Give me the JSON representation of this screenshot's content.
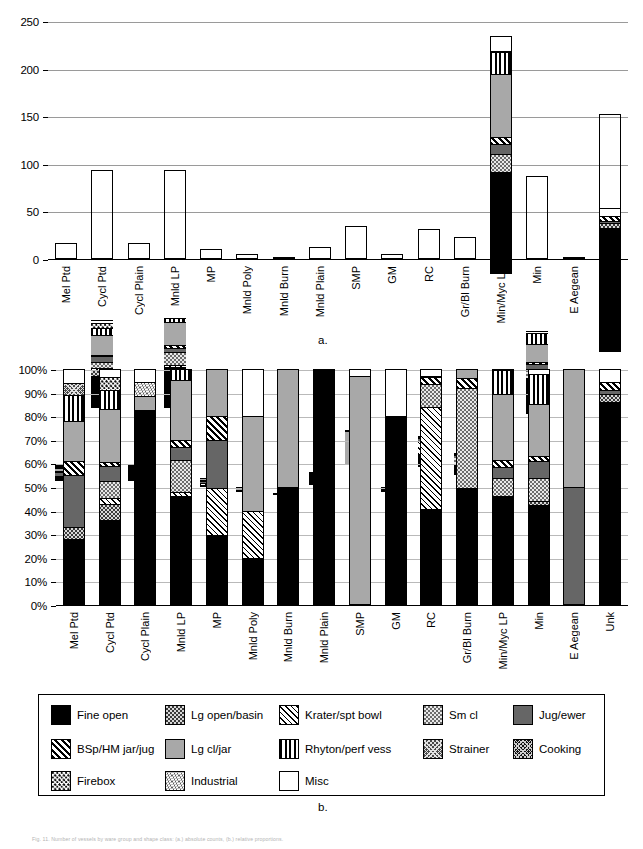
{
  "figure": {
    "panel_a_label": "a.",
    "panel_b_label": "b.",
    "caption": "Fig. 11. Number of vessels by ware group and shape class: (a.) absolute counts, (b.) relative proportions."
  },
  "series": [
    {
      "key": "fine_open",
      "label": "Fine open",
      "pattern": "p-fine-open"
    },
    {
      "key": "lg_open_basin",
      "label": "Lg open/basin",
      "pattern": "p-lg-open-basin"
    },
    {
      "key": "krater_spt_bowl",
      "label": "Krater/spt bowl",
      "pattern": "p-krater"
    },
    {
      "key": "sm_cl",
      "label": "Sm cl",
      "pattern": "p-sm-cl"
    },
    {
      "key": "jug_ewer",
      "label": "Jug/ewer",
      "pattern": "p-jug-ewer"
    },
    {
      "key": "bsp_hm_jar_jug",
      "label": "BSp/HM jar/jug",
      "pattern": "p-bsp-hm"
    },
    {
      "key": "lg_cl_jar",
      "label": "Lg cl/jar",
      "pattern": "p-lg-cl-jar"
    },
    {
      "key": "rhyton_perf_vess",
      "label": "Rhyton/perf vess",
      "pattern": "p-rhyton"
    },
    {
      "key": "strainer",
      "label": "Strainer",
      "pattern": "p-strainer"
    },
    {
      "key": "cooking",
      "label": "Cooking",
      "pattern": "p-cooking"
    },
    {
      "key": "firebox",
      "label": "Firebox",
      "pattern": "p-firebox"
    },
    {
      "key": "industrial",
      "label": "Industrial",
      "pattern": "p-industrial"
    },
    {
      "key": "misc",
      "label": "Misc",
      "pattern": "p-misc"
    }
  ],
  "chart_data": [
    {
      "id": "panel_a",
      "type": "bar",
      "stacked": true,
      "title": "",
      "xlabel": "",
      "ylabel": "",
      "ylim": [
        0,
        250
      ],
      "yticks": [
        0,
        50,
        100,
        150,
        200,
        250
      ],
      "ytick_labels": [
        "0",
        "50",
        "100",
        "150",
        "200",
        "250"
      ],
      "grid": true,
      "legend_position": "below",
      "categories": [
        "Mel Ptd",
        "Cycl Ptd",
        "Cycl Plain",
        "Mnld LP",
        "MP",
        "Mnld Poly",
        "Mnld Burn",
        "Mnld Plain",
        "SMP",
        "GM",
        "RC",
        "Gr/Bl Burn",
        "Min/Myc LP",
        "Min",
        "E Aegean",
        "Unk"
      ],
      "totals": [
        18,
        94,
        17,
        94,
        10,
        5,
        2,
        13,
        35,
        5,
        32,
        23,
        234,
        87,
        2,
        152
      ],
      "series": [
        {
          "name": "Fine open",
          "values": [
            5,
            34,
            14,
            43,
            3,
            1,
            1,
            13,
            0,
            4,
            13,
            11,
            107,
            37,
            0,
            131
          ]
        },
        {
          "name": "Lg open/basin",
          "values": [
            0,
            6,
            0,
            0,
            0,
            0,
            0,
            0,
            0,
            0,
            0,
            0,
            0,
            1,
            0,
            5
          ]
        },
        {
          "name": "Krater/spt bowl",
          "values": [
            0,
            2,
            0,
            2,
            2,
            1,
            0,
            0,
            0,
            0,
            14,
            0,
            0,
            0,
            0,
            0
          ]
        },
        {
          "name": "Sm cl",
          "values": [
            0,
            7,
            0,
            13,
            0,
            0,
            0,
            0,
            0,
            0,
            3,
            10,
            19,
            9,
            0,
            0
          ]
        },
        {
          "name": "Jug/ewer",
          "values": [
            4,
            6,
            0,
            5,
            2,
            0,
            0,
            0,
            0,
            0,
            0,
            0,
            11,
            6,
            1,
            2
          ]
        },
        {
          "name": "BSp/HM jar/jug",
          "values": [
            1,
            1,
            0,
            3,
            1,
            0,
            0,
            0,
            0,
            0,
            1,
            1,
            7,
            2,
            0,
            5
          ]
        },
        {
          "name": "Lg cl/jar",
          "values": [
            3,
            21,
            1,
            24,
            2,
            2,
            1,
            0,
            34,
            0,
            0,
            1,
            66,
            19,
            1,
            0
          ]
        },
        {
          "name": "Rhyton/perf vess",
          "values": [
            2,
            8,
            0,
            4,
            0,
            0,
            0,
            0,
            0,
            0,
            0,
            0,
            23,
            11,
            0,
            0
          ]
        },
        {
          "name": "Strainer",
          "values": [
            1,
            0,
            0,
            0,
            0,
            0,
            0,
            0,
            0,
            0,
            0,
            0,
            0,
            0,
            0,
            0
          ]
        },
        {
          "name": "Cooking",
          "values": [
            0,
            0,
            0,
            0,
            0,
            0,
            0,
            0,
            0,
            0,
            0,
            0,
            0,
            0,
            0,
            0
          ]
        },
        {
          "name": "Firebox",
          "values": [
            0,
            5,
            0,
            0,
            0,
            0,
            0,
            0,
            0,
            0,
            0,
            0,
            0,
            0,
            0,
            0
          ]
        },
        {
          "name": "Industrial",
          "values": [
            0,
            0,
            1,
            0,
            0,
            0,
            0,
            0,
            0,
            0,
            0,
            0,
            0,
            0,
            0,
            0
          ]
        },
        {
          "name": "Misc",
          "values": [
            1,
            3,
            1,
            0,
            0,
            1,
            0,
            0,
            1,
            1,
            1,
            0,
            1,
            2,
            0,
            9
          ]
        }
      ]
    },
    {
      "id": "panel_b",
      "type": "bar",
      "stacked": true,
      "normalized": true,
      "title": "",
      "xlabel": "",
      "ylabel": "",
      "ylim": [
        0,
        100
      ],
      "yticks": [
        0,
        10,
        20,
        30,
        40,
        50,
        60,
        70,
        80,
        90,
        100
      ],
      "ytick_labels": [
        "0%",
        "10%",
        "20%",
        "30%",
        "40%",
        "50%",
        "60%",
        "70%",
        "80%",
        "90%",
        "100%"
      ],
      "grid": true,
      "legend_position": "below",
      "categories": [
        "Mel Ptd",
        "Cycl Ptd",
        "Cycl Plain",
        "Mnld LP",
        "MP",
        "Mnld Poly",
        "Mnld Burn",
        "Mnld Plain",
        "SMP",
        "GM",
        "RC",
        "Gr/Bl Burn",
        "Min/Myc LP",
        "Min",
        "E Aegean",
        "Unk"
      ],
      "series": [
        {
          "name": "Fine open",
          "values": [
            28.0,
            36.0,
            82.5,
            46.0,
            29.5,
            20.0,
            50.0,
            100.0,
            0.0,
            80.0,
            40.5,
            49.5,
            46.0,
            42.5,
            0.0,
            86.0
          ]
        },
        {
          "name": "Lg open/basin",
          "values": [
            5.0,
            7.0,
            0.0,
            0.0,
            0.0,
            0.0,
            0.0,
            0.0,
            0.0,
            0.0,
            0.0,
            0.0,
            0.0,
            1.5,
            0.0,
            3.5
          ]
        },
        {
          "name": "Krater/spt bowl",
          "values": [
            0.0,
            2.5,
            0.0,
            2.0,
            20.0,
            20.0,
            0.0,
            0.0,
            0.0,
            0.0,
            43.5,
            0.0,
            0.0,
            0.0,
            0.0,
            0.0
          ]
        },
        {
          "name": "Sm cl",
          "values": [
            0.0,
            7.0,
            0.0,
            13.5,
            0.0,
            0.0,
            0.0,
            0.0,
            0.0,
            0.0,
            9.5,
            42.5,
            8.0,
            10.0,
            0.0,
            0.0
          ]
        },
        {
          "name": "Jug/ewer",
          "values": [
            22.0,
            6.5,
            0.0,
            5.5,
            20.5,
            0.0,
            0.0,
            0.0,
            0.0,
            0.0,
            0.0,
            0.0,
            4.5,
            7.0,
            50.0,
            1.5
          ]
        },
        {
          "name": "BSp/HM jar/jug",
          "values": [
            6.0,
            1.5,
            0.0,
            3.0,
            10.0,
            0.0,
            0.0,
            0.0,
            0.0,
            0.0,
            3.0,
            4.0,
            3.0,
            2.0,
            0.0,
            3.5
          ]
        },
        {
          "name": "Lg cl/jar",
          "values": [
            17.0,
            22.5,
            6.0,
            25.5,
            20.0,
            40.0,
            50.0,
            0.0,
            97.0,
            0.0,
            0.5,
            4.0,
            28.0,
            22.0,
            50.0,
            0.0
          ]
        },
        {
          "name": "Rhyton/perf vess",
          "values": [
            11.0,
            8.0,
            0.0,
            4.5,
            0.0,
            0.0,
            0.0,
            0.0,
            0.0,
            0.0,
            0.0,
            0.0,
            10.0,
            13.0,
            0.0,
            0.0
          ]
        },
        {
          "name": "Strainer",
          "values": [
            5.0,
            0.0,
            0.0,
            0.0,
            0.0,
            0.0,
            0.0,
            0.0,
            0.0,
            0.0,
            0.0,
            0.0,
            0.0,
            0.0,
            0.0,
            0.0
          ]
        },
        {
          "name": "Cooking",
          "values": [
            0.0,
            0.0,
            0.0,
            0.0,
            0.0,
            0.0,
            0.0,
            0.0,
            0.0,
            0.0,
            0.0,
            0.0,
            0.0,
            0.0,
            0.0,
            0.0
          ]
        },
        {
          "name": "Firebox",
          "values": [
            0.0,
            5.5,
            0.0,
            0.0,
            0.0,
            0.0,
            0.0,
            0.0,
            0.0,
            0.0,
            0.0,
            0.0,
            0.0,
            0.0,
            0.0,
            0.0
          ]
        },
        {
          "name": "Industrial",
          "values": [
            0.0,
            0.0,
            6.0,
            0.0,
            0.0,
            0.0,
            0.0,
            0.0,
            0.0,
            0.0,
            0.0,
            0.0,
            0.0,
            0.0,
            0.0,
            0.0
          ]
        },
        {
          "name": "Misc",
          "values": [
            6.0,
            3.5,
            5.5,
            0.0,
            0.0,
            20.0,
            0.0,
            0.0,
            3.0,
            20.0,
            3.0,
            0.0,
            0.5,
            2.0,
            0.0,
            5.5
          ]
        }
      ]
    }
  ]
}
